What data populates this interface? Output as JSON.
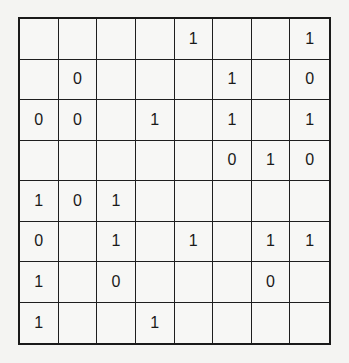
{
  "puzzle": {
    "type": "binary-grid",
    "rows": 8,
    "cols": 8,
    "grid": [
      [
        "",
        "",
        "",
        "",
        "1",
        "",
        "",
        "1"
      ],
      [
        "",
        "0",
        "",
        "",
        "",
        "1",
        "",
        "0"
      ],
      [
        "0",
        "0",
        "",
        "1",
        "",
        "1",
        "",
        "1"
      ],
      [
        "",
        "",
        "",
        "",
        "",
        "0",
        "1",
        "0"
      ],
      [
        "1",
        "0",
        "1",
        "",
        "",
        "",
        "",
        ""
      ],
      [
        "0",
        "",
        "1",
        "",
        "1",
        "",
        "1",
        "1"
      ],
      [
        "1",
        "",
        "0",
        "",
        "",
        "",
        "0",
        ""
      ],
      [
        "1",
        "",
        "",
        "1",
        "",
        "",
        "",
        ""
      ]
    ]
  }
}
